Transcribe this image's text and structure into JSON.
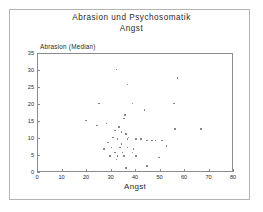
{
  "figure": {
    "title_line1": "Abrasion  und  Psychosomatik",
    "title_line2": "Angst"
  },
  "axes": {
    "xlabel": "Angst",
    "ylabel": "Abrasion (Median)",
    "xticks": [
      "0",
      "10",
      "20",
      "30",
      "40",
      "50",
      "60",
      "70",
      "80"
    ],
    "yticks": [
      "0",
      "5",
      "10",
      "15",
      "20",
      "25",
      "30",
      "35"
    ]
  },
  "colors": {
    "marker": "#707070",
    "axis": "#8c8c8c",
    "frame": "#b4b4b4",
    "text": "#2a2a2a"
  },
  "chart_data": {
    "type": "scatter",
    "title": "Abrasion und Psychosomatik Angst",
    "xlabel": "Angst",
    "ylabel": "Abrasion (Median)",
    "xlim": [
      0,
      80
    ],
    "ylim": [
      0,
      35
    ],
    "xticks": [
      0,
      10,
      20,
      30,
      40,
      50,
      60,
      70,
      80
    ],
    "yticks": [
      0,
      5,
      10,
      15,
      20,
      25,
      30,
      35
    ],
    "grid": false,
    "legend": null,
    "series": [
      {
        "name": "Patienten",
        "points": [
          [
            32.0,
            30.5
          ],
          [
            36.5,
            26.0
          ],
          [
            57.0,
            28.0
          ],
          [
            25.0,
            20.5
          ],
          [
            38.5,
            20.5
          ],
          [
            55.5,
            20.5
          ],
          [
            43.5,
            18.5
          ],
          [
            19.5,
            15.5
          ],
          [
            35.5,
            17.0
          ],
          [
            35.0,
            16.0
          ],
          [
            24.0,
            14.0
          ],
          [
            28.0,
            14.5
          ],
          [
            66.5,
            13.0
          ],
          [
            56.0,
            13.0
          ],
          [
            33.0,
            13.5
          ],
          [
            31.5,
            12.5
          ],
          [
            34.0,
            12.0
          ],
          [
            36.0,
            11.5
          ],
          [
            30.5,
            10.5
          ],
          [
            32.5,
            10.0
          ],
          [
            36.5,
            10.0
          ],
          [
            37.0,
            10.5
          ],
          [
            40.0,
            10.0
          ],
          [
            42.0,
            10.0
          ],
          [
            44.5,
            9.5
          ],
          [
            46.5,
            9.5
          ],
          [
            48.0,
            9.5
          ],
          [
            50.5,
            9.5
          ],
          [
            28.5,
            9.0
          ],
          [
            34.0,
            8.5
          ],
          [
            52.5,
            8.0
          ],
          [
            27.0,
            7.0
          ],
          [
            30.0,
            7.5
          ],
          [
            33.5,
            7.5
          ],
          [
            36.5,
            7.5
          ],
          [
            39.0,
            7.0
          ],
          [
            31.5,
            6.0
          ],
          [
            34.5,
            6.0
          ],
          [
            38.5,
            6.0
          ],
          [
            29.5,
            5.0
          ],
          [
            32.5,
            5.0
          ],
          [
            35.0,
            5.0
          ],
          [
            40.0,
            5.0
          ],
          [
            49.5,
            4.5
          ],
          [
            32.0,
            4.0
          ],
          [
            44.5,
            2.0
          ],
          [
            36.0,
            1.5
          ],
          [
            41.5,
            0.5
          ],
          [
            46.0,
            0.5
          ],
          [
            69.5,
            0.5
          ]
        ]
      }
    ]
  }
}
